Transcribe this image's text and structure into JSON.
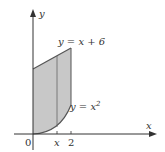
{
  "diagram": {
    "type": "region-between-curves",
    "axes": {
      "x_label": "x",
      "y_label": "y",
      "origin_label": "0"
    },
    "ticks": {
      "x_tick_var": "x",
      "x_tick_2": "2"
    },
    "curves": {
      "upper": "y = x + 6",
      "lower": "y = x²"
    },
    "upper_label_text": "y = x + 6",
    "lower_label_prefix": "y = x",
    "lower_label_exp": "2",
    "colors": {
      "region_fill": "#c8c8c8",
      "line": "#555555",
      "axis": "#333333"
    }
  }
}
